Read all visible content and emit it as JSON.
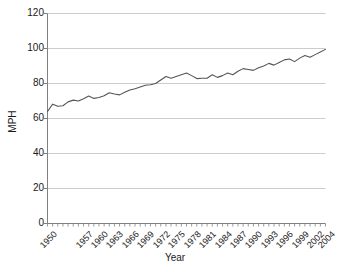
{
  "chart_data": {
    "type": "line",
    "title": "",
    "xlabel": "Year",
    "ylabel": "MPH",
    "ylim": [
      0,
      120
    ],
    "yticks": [
      0,
      20,
      40,
      60,
      80,
      100,
      120
    ],
    "xlim": [
      1950,
      2004
    ],
    "xticks": [
      1950,
      1957,
      1960,
      1963,
      1966,
      1969,
      1972,
      1975,
      1978,
      1981,
      1984,
      1987,
      1990,
      1993,
      1996,
      1999,
      2002,
      2004
    ],
    "grid": "horizontal",
    "legend": "none",
    "line_color": "#555555",
    "axis_color": "#808080",
    "grid_color": "#cccccc",
    "x": [
      1950,
      1951,
      1952,
      1953,
      1954,
      1955,
      1956,
      1957,
      1958,
      1959,
      1960,
      1961,
      1962,
      1963,
      1964,
      1965,
      1966,
      1967,
      1968,
      1969,
      1970,
      1971,
      1972,
      1973,
      1974,
      1975,
      1976,
      1977,
      1978,
      1979,
      1980,
      1981,
      1982,
      1983,
      1984,
      1985,
      1986,
      1987,
      1988,
      1989,
      1990,
      1991,
      1992,
      1993,
      1994,
      1995,
      1996,
      1997,
      1998,
      1999,
      2000,
      2001,
      2002,
      2003,
      2004
    ],
    "values": [
      64.0,
      68.2,
      67.0,
      67.3,
      69.5,
      70.5,
      70.0,
      71.3,
      72.8,
      71.5,
      72.0,
      73.0,
      74.7,
      74.0,
      73.5,
      75.0,
      76.3,
      77.0,
      78.0,
      79.0,
      79.3,
      80.0,
      82.0,
      84.0,
      83.0,
      84.0,
      85.0,
      86.0,
      84.5,
      82.8,
      83.0,
      83.0,
      85.0,
      83.5,
      84.5,
      86.0,
      85.0,
      87.0,
      88.5,
      88.0,
      87.5,
      89.0,
      90.0,
      91.5,
      90.5,
      92.0,
      93.5,
      94.0,
      92.5,
      94.5,
      96.0,
      95.0,
      96.5,
      98.0,
      99.5
    ],
    "series_name": "MPH"
  }
}
